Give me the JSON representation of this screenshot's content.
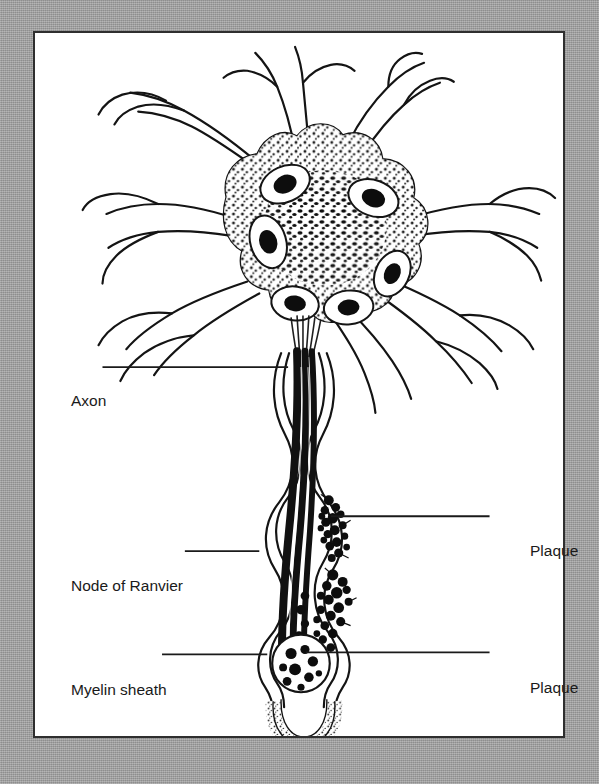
{
  "page": {
    "background_color": "#9b9b9b",
    "panel_background_color": "#ffffff",
    "panel_border_color": "#2f2f2f",
    "ink_color": "#1a1a1a",
    "title_fragment": ""
  },
  "figure": {
    "caption": "",
    "parts": {
      "soma": "cell-body",
      "dendrites": "dendrites",
      "axon": "axon",
      "myelin_sheath": "myelin-sheath",
      "node_of_ranvier": "node-of-ranvier",
      "plaque": "plaque",
      "terminal_bulb": "axon-terminal-bulb"
    }
  },
  "labels": [
    {
      "id": "axon",
      "text": "Axon",
      "side": "left",
      "leader": {
        "x1": 100,
        "y1": 367,
        "x2": 287,
        "y2": 367
      }
    },
    {
      "id": "node-of-ranvier",
      "text": "Node of Ranvier",
      "side": "left",
      "leader": {
        "x1": 183,
        "y1": 552,
        "x2": 258,
        "y2": 552
      }
    },
    {
      "id": "myelin-sheath",
      "text": "Myelin sheath",
      "side": "left",
      "leader": {
        "x1": 160,
        "y1": 656,
        "x2": 266,
        "y2": 656
      }
    },
    {
      "id": "plaque-upper",
      "text": "Plaque",
      "side": "right",
      "leader": {
        "x1": 330,
        "y1": 517,
        "x2": 490,
        "y2": 517
      }
    },
    {
      "id": "plaque-lower",
      "text": "Plaque",
      "side": "right",
      "leader": {
        "x1": 305,
        "y1": 654,
        "x2": 490,
        "y2": 654
      }
    }
  ]
}
